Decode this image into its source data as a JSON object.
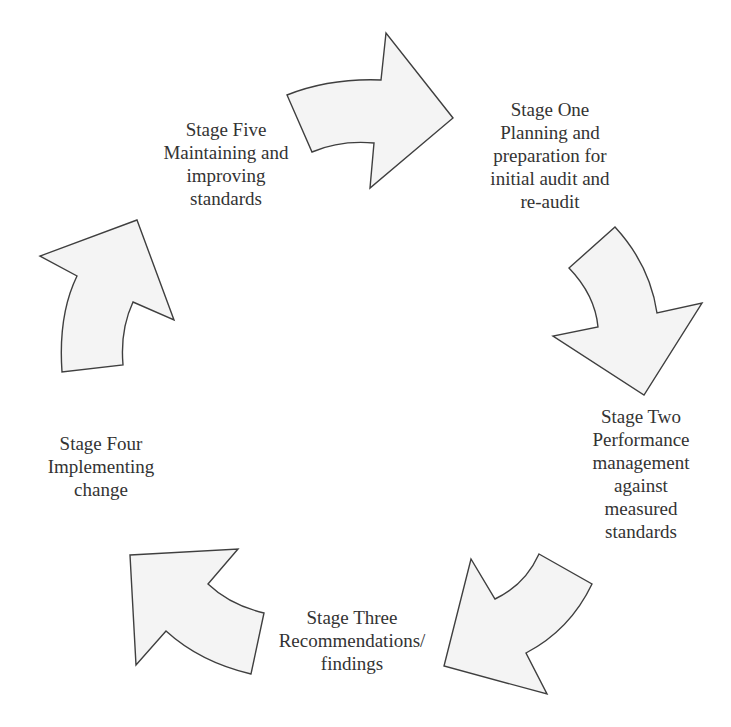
{
  "diagram": {
    "type": "cycle",
    "colors": {
      "arrow_fill": "#f4f4f4",
      "arrow_stroke": "#3f3f3f",
      "text": "#333333",
      "background": "#ffffff"
    },
    "stages": [
      {
        "id": "stage-one",
        "lines": [
          "Stage One",
          "Planning and",
          "preparation for",
          "initial audit and",
          "re-audit"
        ]
      },
      {
        "id": "stage-two",
        "lines": [
          "Stage Two",
          "Performance",
          "management",
          "against",
          "measured",
          "standards"
        ]
      },
      {
        "id": "stage-three",
        "lines": [
          "Stage Three",
          "Recommendations/",
          "findings"
        ]
      },
      {
        "id": "stage-four",
        "lines": [
          "Stage Four",
          "Implementing",
          "change"
        ]
      },
      {
        "id": "stage-five",
        "lines": [
          "Stage Five",
          "Maintaining and",
          "improving",
          "standards"
        ]
      }
    ],
    "arrows": [
      {
        "id": "arrow-five-to-one",
        "direction": "right"
      },
      {
        "id": "arrow-one-to-two",
        "direction": "down"
      },
      {
        "id": "arrow-two-to-three",
        "direction": "down-left"
      },
      {
        "id": "arrow-three-to-four",
        "direction": "up-left"
      },
      {
        "id": "arrow-four-to-five",
        "direction": "up"
      }
    ]
  }
}
